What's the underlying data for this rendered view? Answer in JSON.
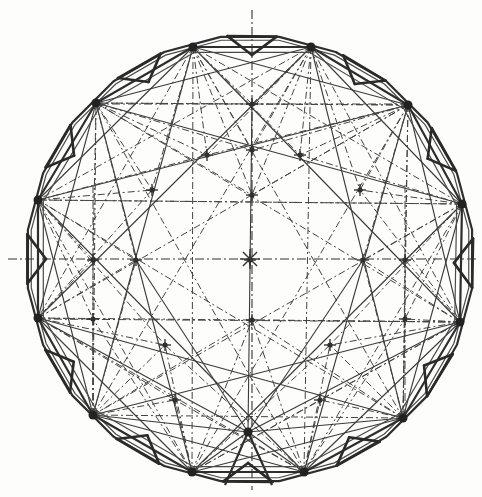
{
  "drawing": {
    "type": "circular dome roof plan with perimeter ring truss",
    "ink_color": "#2e2e2e",
    "paper_color": "#fdfdfc",
    "center": [
      250,
      259
    ],
    "radius": 224,
    "axes": {
      "vertical": {
        "x": 252,
        "y1": 10,
        "y2": 490
      },
      "horizontal": {
        "y": 259,
        "x1": 8,
        "x2": 476
      }
    },
    "ring_hubs": [
      [
        193,
        47
      ],
      [
        311,
        47
      ],
      [
        408,
        105
      ],
      [
        462,
        204
      ],
      [
        460,
        322
      ],
      [
        403,
        418
      ],
      [
        304,
        472
      ],
      [
        192,
        472
      ],
      [
        93,
        415
      ],
      [
        38,
        318
      ],
      [
        38,
        200
      ],
      [
        96,
        103
      ]
    ],
    "bottom_apex": [
      248,
      432
    ],
    "interior_nodes": [
      [
        252,
        104
      ],
      [
        252,
        150
      ],
      [
        252,
        195
      ],
      [
        250,
        260
      ],
      [
        93,
        260
      ],
      [
        136,
        260
      ],
      [
        363,
        260
      ],
      [
        405,
        260
      ],
      [
        152,
        190
      ],
      [
        360,
        190
      ],
      [
        165,
        345
      ],
      [
        330,
        345
      ],
      [
        207,
        155
      ],
      [
        300,
        155
      ],
      [
        93,
        319
      ],
      [
        405,
        319
      ],
      [
        252,
        320
      ],
      [
        175,
        400
      ],
      [
        320,
        400
      ]
    ],
    "grid_lines": [
      [
        96,
        104,
        408,
        104
      ],
      [
        38,
        319,
        460,
        322
      ],
      [
        93,
        185,
        93,
        415
      ],
      [
        405,
        185,
        405,
        418
      ],
      [
        38,
        200,
        462,
        204
      ]
    ],
    "labels": []
  }
}
